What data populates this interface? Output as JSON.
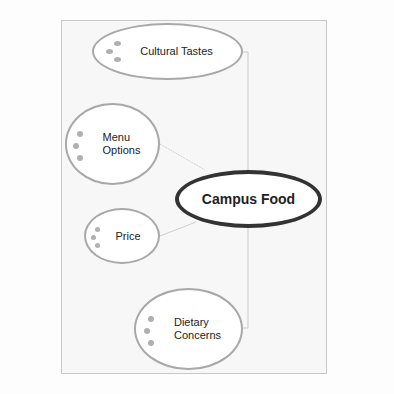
{
  "diagram": {
    "type": "concept-map",
    "central_node": {
      "label": "Campus Food"
    },
    "nodes": [
      {
        "label": "Cultural Tastes"
      },
      {
        "label": "Menu Options",
        "lines": [
          "Menu",
          "Options"
        ]
      },
      {
        "label": "Price"
      },
      {
        "label": "Dietary Concerns",
        "lines": [
          "Dietary",
          "Concerns"
        ]
      }
    ],
    "colors": {
      "node_border": "#a8a8a8",
      "central_border": "#333333",
      "connector": "#c8c8c8",
      "bullet": "#b0b0b0"
    }
  }
}
